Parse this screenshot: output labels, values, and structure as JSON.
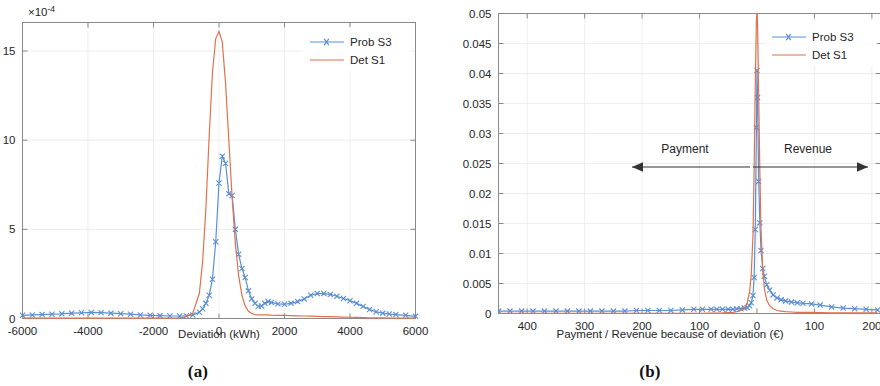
{
  "figure": {
    "panels": [
      {
        "id": "a",
        "caption": "(a)",
        "xlabel": "Deviation (kWh)",
        "y_exponent_base": "×10",
        "y_exponent_power": "-4",
        "legend": [
          {
            "name": "Prob S3",
            "color": "#5b8fd4",
            "marker": "x"
          },
          {
            "name": "Det S1",
            "color": "#e0714f",
            "marker": "none"
          }
        ],
        "xticks": [
          "-6000",
          "-4000",
          "-2000",
          "0",
          "2000",
          "4000",
          "6000"
        ],
        "yticks": [
          "0",
          "5",
          "10",
          "15"
        ]
      },
      {
        "id": "b",
        "caption": "(b)",
        "xlabel": "Payment / Revenue because of deviation (€)",
        "legend": [
          {
            "name": "Prob S3",
            "color": "#5b8fd4",
            "marker": "x"
          },
          {
            "name": "Det S1",
            "color": "#e0714f",
            "marker": "none"
          }
        ],
        "xticks": [
          "400",
          "300",
          "200",
          "100",
          "0",
          "100",
          "200"
        ],
        "yticks": [
          "0",
          "0.005",
          "0.01",
          "0.015",
          "0.02",
          "0.025",
          "0.03",
          "0.035",
          "0.04",
          "0.045",
          "0.05"
        ],
        "annotations": [
          {
            "label": "Payment",
            "direction": "left"
          },
          {
            "label": "Revenue",
            "direction": "right"
          }
        ]
      }
    ]
  },
  "chart_data": [
    {
      "type": "line",
      "panel": "a",
      "title": "",
      "xlabel": "Deviation (kWh)",
      "ylabel": "",
      "y_scale_note": "values are ×10^-4",
      "xlim": [
        -6000,
        6000
      ],
      "ylim": [
        0,
        16.6
      ],
      "xticks": [
        -6000,
        -4000,
        -2000,
        0,
        2000,
        4000,
        6000
      ],
      "yticks": [
        0,
        5,
        10,
        15
      ],
      "grid": true,
      "legend_position": "top-right",
      "x": [
        -6000,
        -5700,
        -5400,
        -5100,
        -4800,
        -4500,
        -4200,
        -3900,
        -3600,
        -3300,
        -3000,
        -2700,
        -2400,
        -2100,
        -1800,
        -1500,
        -1200,
        -1000,
        -800,
        -600,
        -500,
        -400,
        -300,
        -200,
        -100,
        0,
        100,
        200,
        300,
        400,
        500,
        600,
        700,
        800,
        900,
        1000,
        1100,
        1200,
        1300,
        1400,
        1500,
        1600,
        1800,
        2000,
        2200,
        2400,
        2600,
        2800,
        3000,
        3200,
        3400,
        3600,
        3800,
        4000,
        4200,
        4400,
        4600,
        4800,
        5000,
        5200,
        5400,
        5700,
        6000
      ],
      "series": [
        {
          "name": "Prob S3",
          "color": "#5b8fd4",
          "marker": "x",
          "values": [
            0.18,
            0.2,
            0.22,
            0.24,
            0.26,
            0.3,
            0.32,
            0.34,
            0.33,
            0.3,
            0.27,
            0.24,
            0.2,
            0.18,
            0.16,
            0.14,
            0.14,
            0.15,
            0.2,
            0.35,
            0.55,
            0.85,
            1.3,
            2.2,
            4.3,
            7.6,
            9.1,
            8.7,
            7.0,
            6.9,
            5.0,
            3.6,
            2.8,
            2.3,
            1.55,
            1.1,
            0.85,
            0.68,
            0.7,
            0.85,
            0.95,
            0.9,
            0.82,
            0.8,
            0.85,
            0.95,
            1.1,
            1.3,
            1.4,
            1.4,
            1.35,
            1.25,
            1.12,
            1.0,
            0.85,
            0.68,
            0.5,
            0.38,
            0.3,
            0.25,
            0.22,
            0.18,
            0.12
          ]
        },
        {
          "name": "Det S1",
          "color": "#e0714f",
          "marker": "none",
          "values": [
            0.02,
            0.02,
            0.02,
            0.02,
            0.02,
            0.02,
            0.02,
            0.02,
            0.02,
            0.02,
            0.02,
            0.02,
            0.02,
            0.02,
            0.02,
            0.02,
            0.04,
            0.1,
            0.3,
            1.4,
            3.2,
            6.2,
            10.2,
            13.8,
            15.7,
            16.1,
            15.5,
            13.2,
            10.0,
            6.8,
            4.2,
            2.4,
            1.3,
            0.7,
            0.4,
            0.28,
            0.22,
            0.2,
            0.2,
            0.2,
            0.2,
            0.19,
            0.18,
            0.17,
            0.16,
            0.15,
            0.14,
            0.13,
            0.12,
            0.11,
            0.1,
            0.09,
            0.08,
            0.07,
            0.06,
            0.05,
            0.04,
            0.03,
            0.03,
            0.02,
            0.02,
            0.02,
            0.02
          ]
        }
      ]
    },
    {
      "type": "line",
      "panel": "b",
      "title": "",
      "xlabel": "Payment / Revenue because of deviation (€)",
      "ylabel": "",
      "xlim": [
        -450,
        215
      ],
      "ylim": [
        0,
        0.05
      ],
      "x_axis_note": "axis reversed: payment values shown left of 0 as positive magnitudes",
      "xticks": [
        -400,
        -300,
        -200,
        -100,
        0,
        100,
        200
      ],
      "xticklabels": [
        "400",
        "300",
        "200",
        "100",
        "0",
        "100",
        "200"
      ],
      "yticks": [
        0,
        0.005,
        0.01,
        0.015,
        0.02,
        0.025,
        0.03,
        0.035,
        0.04,
        0.045,
        0.05
      ],
      "grid": true,
      "legend_position": "top-right",
      "x": [
        -450,
        -430,
        -410,
        -390,
        -370,
        -350,
        -330,
        -310,
        -290,
        -270,
        -250,
        -230,
        -210,
        -190,
        -170,
        -150,
        -130,
        -110,
        -95,
        -80,
        -70,
        -60,
        -50,
        -42,
        -35,
        -28,
        -22,
        -17,
        -13,
        -10,
        -7,
        -5,
        -3,
        -1,
        0,
        1,
        3,
        5,
        7,
        10,
        13,
        17,
        22,
        28,
        35,
        42,
        50,
        60,
        70,
        80,
        95,
        110,
        130,
        150,
        170,
        190,
        210
      ],
      "series": [
        {
          "name": "Prob S3",
          "color": "#5b8fd4",
          "marker": "x",
          "values": [
            0.0004,
            0.0004,
            0.0004,
            0.0004,
            0.0004,
            0.0004,
            0.0004,
            0.0004,
            0.0004,
            0.0004,
            0.0004,
            0.0004,
            0.0005,
            0.0005,
            0.0005,
            0.0005,
            0.0006,
            0.0007,
            0.0007,
            0.0007,
            0.0007,
            0.0007,
            0.0007,
            0.0007,
            0.0008,
            0.0008,
            0.0009,
            0.001,
            0.0013,
            0.0018,
            0.003,
            0.006,
            0.014,
            0.031,
            0.0405,
            0.036,
            0.022,
            0.0151,
            0.0105,
            0.0075,
            0.0062,
            0.0048,
            0.0039,
            0.0031,
            0.0026,
            0.0023,
            0.0021,
            0.0019,
            0.0018,
            0.0017,
            0.0016,
            0.0014,
            0.0011,
            0.0009,
            0.0008,
            0.0007,
            0.0006
          ]
        },
        {
          "name": "Det S1",
          "color": "#e0714f",
          "marker": "none",
          "values": [
            2e-05,
            2e-05,
            2e-05,
            2e-05,
            2e-05,
            2e-05,
            2e-05,
            2e-05,
            2e-05,
            2e-05,
            2e-05,
            2e-05,
            2e-05,
            2e-05,
            2e-05,
            2e-05,
            2e-05,
            3e-05,
            4e-05,
            6e-05,
            8e-05,
            0.0001,
            0.00015,
            0.0002,
            0.0003,
            0.0005,
            0.0009,
            0.0018,
            0.0035,
            0.0065,
            0.013,
            0.024,
            0.038,
            0.049,
            0.0502,
            0.048,
            0.036,
            0.0235,
            0.014,
            0.0072,
            0.004,
            0.0022,
            0.0013,
            0.0008,
            0.0005,
            0.0004,
            0.0003,
            0.00025,
            0.0002,
            0.0002,
            0.00018,
            0.00015,
            0.00012,
            0.0001,
            0.0001,
            0.0001,
            0.0001
          ]
        }
      ]
    }
  ]
}
